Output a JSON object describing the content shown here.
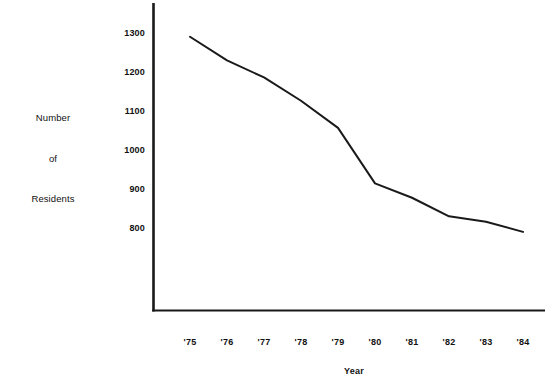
{
  "chart_data": {
    "type": "line",
    "title": "",
    "xlabel": "Year",
    "ylabel": "Number of Residents",
    "ylabel_lines": [
      "Number",
      "of",
      "Residents"
    ],
    "categories": [
      "'75",
      "'76",
      "'77",
      "'78",
      "'79",
      "'80",
      "'81",
      "'82",
      "'83",
      "'84"
    ],
    "values": [
      1293,
      1232,
      1188,
      1128,
      1058,
      915,
      878,
      830,
      816,
      790
    ],
    "series": [
      {
        "name": "Number of Residents",
        "values": [
          1293,
          1232,
          1188,
          1128,
          1058,
          915,
          878,
          830,
          816,
          790
        ]
      }
    ],
    "ytick_labels": [
      "1300",
      "1200",
      "1100",
      "1000",
      "900",
      "800"
    ],
    "ytick_values": [
      1300,
      1200,
      1100,
      1000,
      900,
      800
    ],
    "xtick_labels": [
      "'75",
      "'76",
      "'77",
      "'78",
      "'79",
      "'80",
      "'81",
      "'82",
      "'83",
      "'84"
    ],
    "ylim": [
      760,
      1340
    ],
    "xlim": [
      "'75",
      "'84"
    ],
    "grid": false,
    "legend": "none",
    "line_color": "#1a1a1a",
    "axis_color": "#1a1a1a",
    "background_color": "#ffffff"
  },
  "axes": {
    "y_title_line1": "Number",
    "y_title_line2": "of",
    "y_title_line3": "Residents",
    "x_title": "Year"
  },
  "yticks": [
    {
      "label": "1300"
    },
    {
      "label": "1200"
    },
    {
      "label": "1100"
    },
    {
      "label": "1000"
    },
    {
      "label": "900"
    },
    {
      "label": "800"
    }
  ],
  "xticks": [
    {
      "label": "'75"
    },
    {
      "label": "'76"
    },
    {
      "label": "'77"
    },
    {
      "label": "'78"
    },
    {
      "label": "'79"
    },
    {
      "label": "'80"
    },
    {
      "label": "'81"
    },
    {
      "label": "'82"
    },
    {
      "label": "'83"
    },
    {
      "label": "'84"
    }
  ]
}
